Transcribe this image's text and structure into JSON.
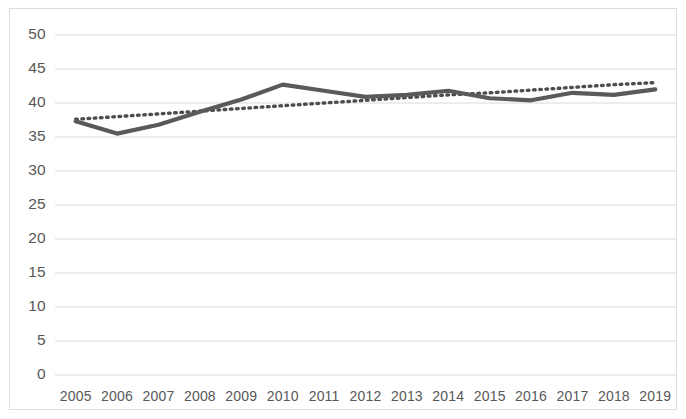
{
  "chart_data": {
    "type": "line",
    "title": "",
    "subtitle": "",
    "xlabel": "",
    "ylabel": "",
    "categories": [
      "2005",
      "2006",
      "2007",
      "2008",
      "2009",
      "2010",
      "2011",
      "2012",
      "2013",
      "2014",
      "2015",
      "2016",
      "2017",
      "2018",
      "2019"
    ],
    "series": [
      {
        "name": "Value",
        "style": "solid",
        "color": "#5a5a5a",
        "values": [
          37.3,
          35.5,
          36.8,
          38.7,
          40.5,
          42.7,
          41.8,
          40.9,
          41.2,
          41.8,
          40.7,
          40.4,
          41.5,
          41.2,
          42.0
        ]
      },
      {
        "name": "Trendline",
        "style": "dotted",
        "color": "#4d4d4d",
        "values": [
          37.6,
          38.0,
          38.4,
          38.8,
          39.2,
          39.6,
          40.0,
          40.4,
          40.8,
          41.2,
          41.5,
          41.9,
          42.3,
          42.7,
          43.0
        ]
      }
    ],
    "ylim": [
      0,
      50
    ],
    "ytick_values": [
      0,
      5,
      10,
      15,
      20,
      25,
      30,
      35,
      40,
      45,
      50
    ],
    "ytick_labels": [
      "0",
      "5",
      "10",
      "15",
      "20",
      "25",
      "30",
      "35",
      "40",
      "45",
      "50"
    ],
    "grid": true,
    "grid_axis": "y",
    "legend": false,
    "legend_position": "none",
    "annotations": []
  },
  "colors": {
    "series_line": "#5a5a5a",
    "trend_line": "#4d4d4d",
    "gridline": "#d9d9d9",
    "border": "#dcdcdc",
    "tick_text": "#585858",
    "background": "#ffffff"
  }
}
